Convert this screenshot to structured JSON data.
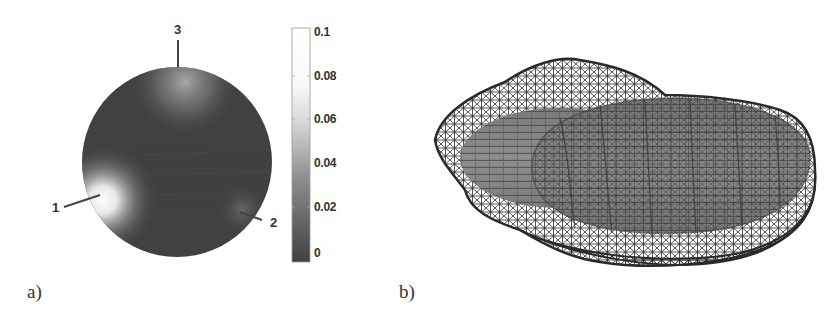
{
  "panels": [
    {
      "id": "a",
      "label": "a)",
      "type": "sphere-colormap",
      "markers": [
        {
          "label": "1",
          "description": "bright spot on left side"
        },
        {
          "label": "2",
          "description": "lower right"
        },
        {
          "label": "3",
          "description": "top pole"
        }
      ],
      "colorbar": {
        "ticks": [
          "0.1",
          "0.08",
          "0.06",
          "0.04",
          "0.02",
          "0"
        ],
        "min": 0,
        "max": 0.1,
        "colormap": "grayscale-dark-to-light"
      }
    },
    {
      "id": "b",
      "label": "b)",
      "type": "3d-wireframe-over-ellipsoid",
      "description": "Triangulated wireframe mesh enclosing a shaded oblate ellipsoid surface"
    }
  ],
  "colors": {
    "sphere_dark": "#3c3c3c",
    "sphere_highlight": "#f4f4f4",
    "ellipsoid_fill": "#8a8a8a",
    "mesh_stroke": "#2a2a2a",
    "text": "#333333"
  }
}
